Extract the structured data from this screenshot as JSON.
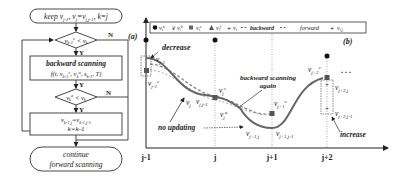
{
  "flowchart": {
    "panel_label": "(a)",
    "start": "keep v_{j-1}, v_j=v_{j,j-1}, k=j",
    "start_parts": {
      "a": "keep v",
      "a_sub": "j-1",
      "b": ", v",
      "b_sub": "j",
      "c": "=v",
      "c_sub": "j,j-1",
      "d": ", k=j"
    },
    "decision1": {
      "lhs": "v",
      "lhs_sub": "k-1",
      "lhs_sup": "c",
      "op": " < v",
      "rhs_sub": "k",
      "yes": "Y",
      "no": "N"
    },
    "process1": {
      "line1": "backward scanning",
      "line2": "f(t, v_{k-1}^c, v_k^a, s_{k-1}, T)",
      "l2a": "f(t, v",
      "l2a_sub": "k-1",
      "l2a_sup": "c",
      "l2b": ", v",
      "l2b_sub": "k",
      "l2b_sup": "a",
      "l2c": ", s",
      "l2c_sub": "k-1",
      "l2d": ", T)",
      "yes": "Y"
    },
    "decision2": {
      "lhs": "v",
      "lhs_sub": "k",
      "lhs_sup": "a",
      "op": " < v",
      "rhs_sub": "k",
      "yes": "Y",
      "no": "N"
    },
    "process2": {
      "line1a": "v",
      "line1a_sub": "k-1,j",
      "line1b": "=v",
      "line1b_sub": "k-1,j-1",
      "line2": "k=k-1"
    },
    "end": {
      "line1": "continue",
      "line2": "forward scanning"
    }
  },
  "chart": {
    "panel_label": "(b)",
    "legend": [
      {
        "marker": "circle",
        "label": "v",
        "sub": "i",
        "sup": "u"
      },
      {
        "marker": "v-check",
        "label": "v",
        "sub": "i",
        "sup": "b"
      },
      {
        "marker": "square",
        "label": "v",
        "sub": "i",
        "sup": "c"
      },
      {
        "marker": "triangle",
        "label": "v",
        "sub": "i",
        "sup": "f"
      },
      {
        "marker": "plus",
        "label": "v",
        "sub": "i",
        "sup": ""
      },
      {
        "marker": "dashed-line",
        "label": "backward"
      },
      {
        "marker": "dashed-line",
        "label": "forward"
      },
      {
        "marker": "plus-gray",
        "label": "v",
        "sub": "i,j",
        "sup": ""
      }
    ],
    "x_ticks": [
      "j-1",
      "j",
      "j+1",
      "j+2"
    ],
    "annotations": {
      "decrease": "decrease",
      "backward_again_1": "backward scanning",
      "backward_again_2": "again",
      "no_updating": "no updating",
      "increase": "increase",
      "ellipsis": ". . ."
    },
    "point_labels": {
      "vj1": {
        "t": "v",
        "sub": "j-1"
      },
      "vj1c": {
        "t": "v",
        "sub": "j-1",
        "sup": "c"
      },
      "vj": {
        "t": "v",
        "sub": "j"
      },
      "vjj1": {
        "t": "v",
        "sub": "j,j-1"
      },
      "vjc": {
        "t": "v",
        "sub": "j",
        "sup": "c"
      },
      "vja": {
        "t": "v",
        "sub": "j",
        "sup": "a"
      },
      "vj1j": {
        "t": "v",
        "sub": "j+1,j"
      },
      "vj1j1": {
        "t": "v",
        "sub": "j+1,j-1"
      },
      "vjp1c": {
        "t": "v",
        "sub": "j+1",
        "sup": "c"
      },
      "vj2c": {
        "t": "v",
        "sub": "j+2",
        "sup": "c"
      },
      "vj2j": {
        "t": "v",
        "sub": "j+2,j"
      },
      "vj2j1": {
        "t": "v",
        "sub": "j+2,j-1"
      }
    }
  }
}
